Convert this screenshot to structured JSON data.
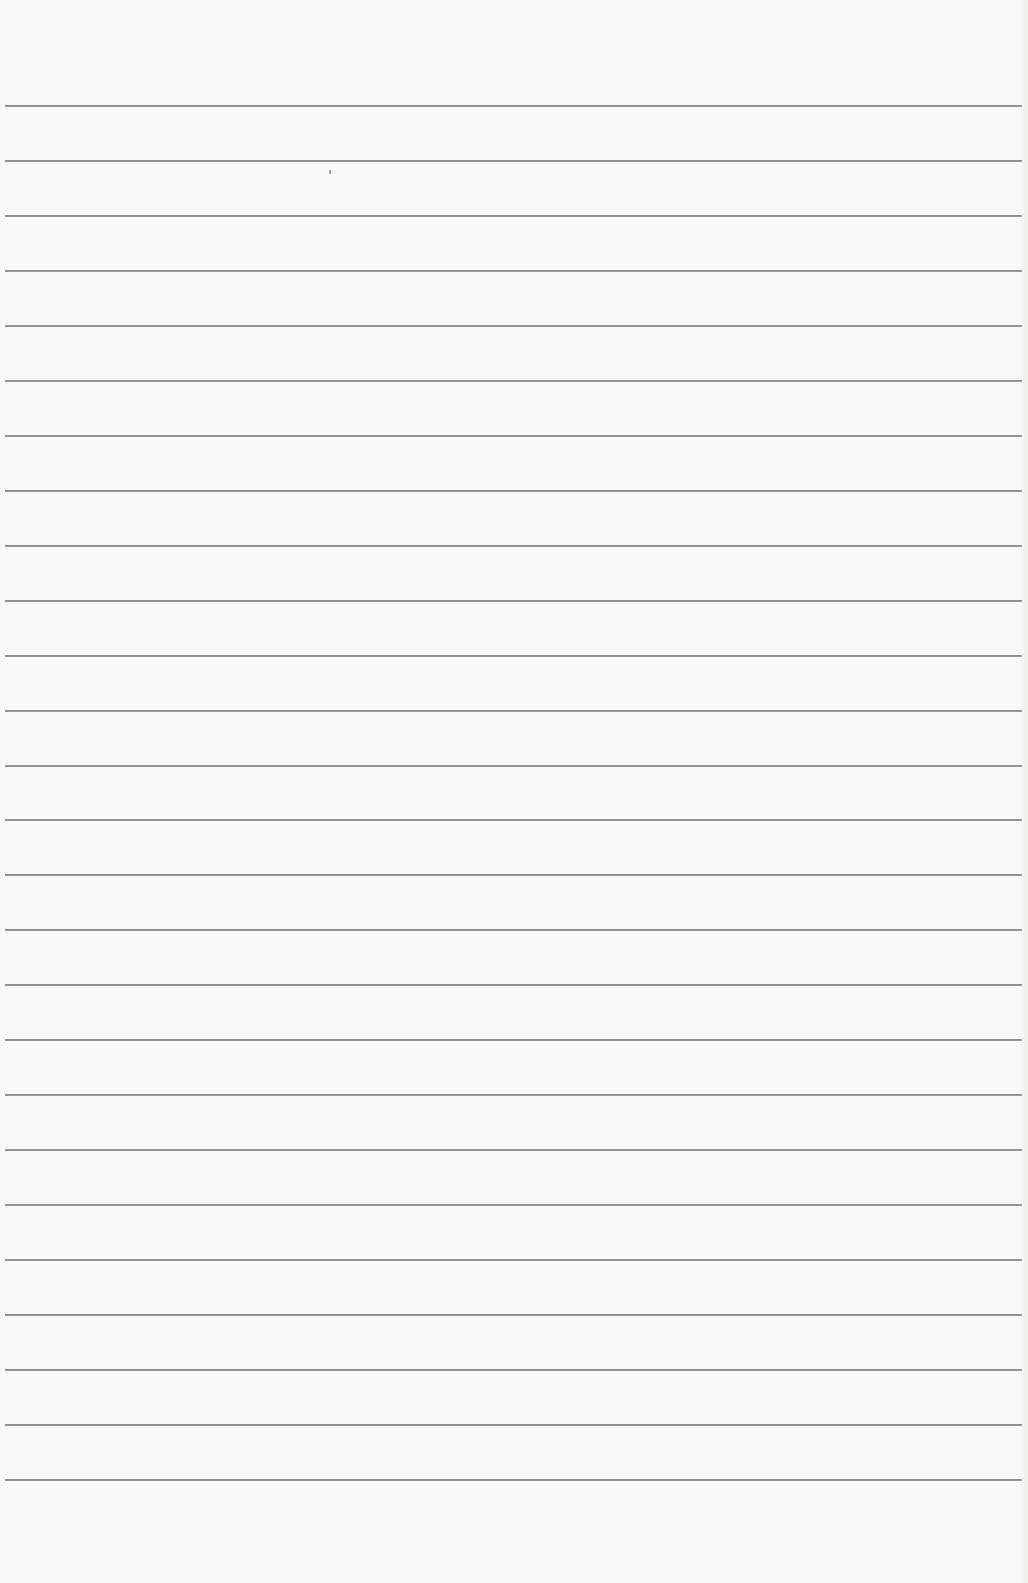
{
  "paper": {
    "type": "lined-paper",
    "background_color": "#f8f8f6",
    "rule_color": "#8f8f8f",
    "rule_count": 26,
    "first_rule_y": 105,
    "rule_spacing": 54.96,
    "rule_left": 5,
    "rule_right_inset": 6
  }
}
